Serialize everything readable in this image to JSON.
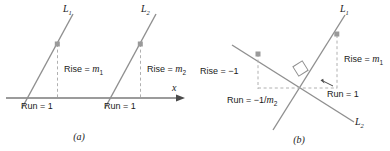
{
  "figure": {
    "kind": "geometry-diagram",
    "colors": {
      "line": "#8f8f8f",
      "axis": "#7a7a7a",
      "dashed": "#b0b0b0",
      "marker": "#9a9a9a",
      "text": "#1a1a1a"
    }
  },
  "panel_a": {
    "caption": "(a)",
    "axis_label": "x",
    "line_labels": {
      "first": "L",
      "first_sub": "1",
      "second": "L",
      "second_sub": "2"
    },
    "annotations": {
      "rise_1_prefix": "Rise = ",
      "rise_1_var": "m",
      "rise_1_sub": "1",
      "rise_2_prefix": "Rise = ",
      "rise_2_var": "m",
      "rise_2_sub": "2",
      "run_1": "Run = 1",
      "run_2": "Run = 1"
    }
  },
  "panel_b": {
    "caption": "(b)",
    "line_labels": {
      "first": "L",
      "first_sub": "1",
      "second": "L",
      "second_sub": "2"
    },
    "annotations": {
      "rise_neg1": "Rise = −1",
      "rise_m1_prefix": "Rise = ",
      "rise_m1_var": "m",
      "rise_m1_sub": "1",
      "run_neg_prefix": "Run = −1/",
      "run_neg_var": "m",
      "run_neg_sub": "2",
      "run_1": "Run = 1"
    },
    "right_angle_marker": "right-angle-square"
  }
}
